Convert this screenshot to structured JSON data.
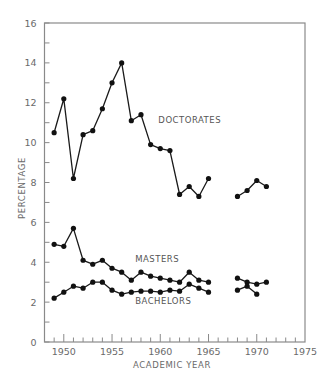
{
  "chart_data": {
    "type": "line",
    "title": "",
    "xlabel": "ACADEMIC YEAR",
    "ylabel": "PERCENTAGE",
    "xlim": [
      1948,
      1975
    ],
    "ylim": [
      0,
      16
    ],
    "x_ticks": [
      1950,
      1955,
      1960,
      1965,
      1970,
      1975
    ],
    "y_ticks": [
      0,
      2,
      4,
      6,
      8,
      10,
      12,
      14,
      16
    ],
    "grid": false,
    "legend": "inline labels",
    "series": [
      {
        "name": "DOCTORATES",
        "label_pos": {
          "x": 1959.8,
          "y": 11.0
        },
        "segments": [
          {
            "x": [
              1949,
              1950,
              1951,
              1952,
              1953,
              1954,
              1955,
              1956,
              1957,
              1958,
              1959,
              1960,
              1961,
              1962,
              1963,
              1964,
              1965
            ],
            "y": [
              10.5,
              12.2,
              8.2,
              10.4,
              10.6,
              11.7,
              13.0,
              14.0,
              11.1,
              11.4,
              9.9,
              9.7,
              9.6,
              7.4,
              7.8,
              7.3,
              8.2
            ]
          },
          {
            "x": [
              1968,
              1969,
              1970,
              1971
            ],
            "y": [
              7.3,
              7.6,
              8.1,
              7.8
            ]
          }
        ]
      },
      {
        "name": "MASTERS",
        "label_pos": {
          "x": 1957.4,
          "y": 4.0
        },
        "segments": [
          {
            "x": [
              1949,
              1950,
              1951,
              1952,
              1953,
              1954,
              1955,
              1956,
              1957,
              1958,
              1959,
              1960,
              1961,
              1962,
              1963,
              1964,
              1965
            ],
            "y": [
              4.9,
              4.8,
              5.7,
              4.1,
              3.9,
              4.1,
              3.7,
              3.5,
              3.1,
              3.5,
              3.3,
              3.2,
              3.1,
              3.0,
              3.5,
              3.1,
              3.0
            ]
          },
          {
            "x": [
              1968,
              1969,
              1970,
              1971
            ],
            "y": [
              3.2,
              3.0,
              2.9,
              3.0
            ]
          }
        ]
      },
      {
        "name": "BACHELORS",
        "label_pos": {
          "x": 1957.4,
          "y": 1.9
        },
        "segments": [
          {
            "x": [
              1949,
              1950,
              1951,
              1952,
              1953,
              1954,
              1955,
              1956,
              1957,
              1958,
              1959,
              1960,
              1961,
              1962,
              1963,
              1964,
              1965
            ],
            "y": [
              2.2,
              2.5,
              2.8,
              2.7,
              3.0,
              3.0,
              2.6,
              2.4,
              2.5,
              2.55,
              2.55,
              2.5,
              2.6,
              2.55,
              2.9,
              2.7,
              2.5
            ]
          },
          {
            "x": [
              1968,
              1969,
              1970
            ],
            "y": [
              2.6,
              2.8,
              2.4
            ]
          }
        ]
      }
    ]
  },
  "colors": {
    "line": "#1a1a1a",
    "marker": "#111111",
    "axis": "#8a8a8a",
    "text": "#6a6a6a"
  }
}
